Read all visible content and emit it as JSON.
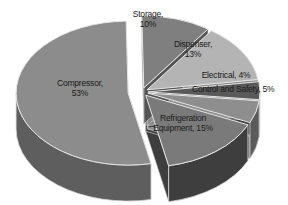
{
  "chart_data": {
    "type": "pie",
    "style": "3d-exploded",
    "title": "",
    "categories": [
      "Compressor",
      "Storage",
      "Dispenser",
      "Electrical",
      "Control and Safety",
      "Refrigeration Equipment"
    ],
    "values": [
      53,
      10,
      13,
      4,
      5,
      15
    ],
    "unit": "%",
    "labels": [
      {
        "name": "Compressor",
        "line1": "Compressor,",
        "line2": "53%"
      },
      {
        "name": "Storage",
        "line1": "Storage,",
        "line2": "10%"
      },
      {
        "name": "Dispenser",
        "line1": "Dispenser,",
        "line2": "13%"
      },
      {
        "name": "Electrical",
        "line1": "Electrical, 4%",
        "line2": ""
      },
      {
        "name": "Control and Safety",
        "line1": "Control and Safety, 5%",
        "line2": ""
      },
      {
        "name": "Refrigeration Equipment",
        "line1": "Refrigeration",
        "line2": "Equipment, 15%"
      }
    ],
    "colors": {
      "Compressor": {
        "top": "#8c8c8c",
        "side": "#5e5e5e"
      },
      "Storage": {
        "top": "#7f7f7f",
        "side": "#555555"
      },
      "Dispenser": {
        "top": "#b4b4b4",
        "side": "#8a8a8a"
      },
      "Electrical": {
        "top": "#5a5a5a",
        "side": "#3c3c3c"
      },
      "Control and Safety": {
        "top": "#8e8e8e",
        "side": "#5a5a5a"
      },
      "Refrigeration Equipment": {
        "top": "#7a7a7a",
        "side": "#3e3e3e"
      }
    },
    "legend": "none (data labels on slices)"
  }
}
